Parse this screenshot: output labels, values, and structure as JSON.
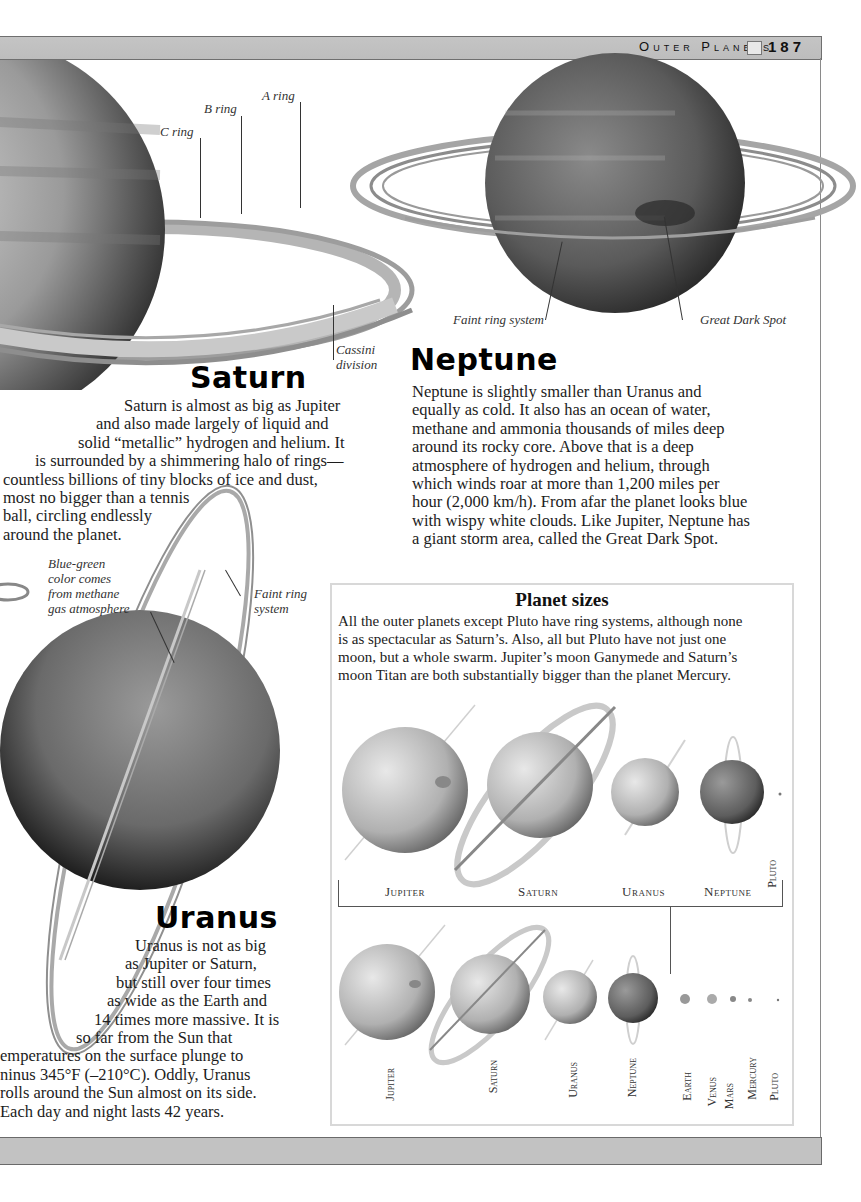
{
  "header": {
    "running_head": "Outer Planets",
    "page_icon": "book-page-icon",
    "page_number": "187"
  },
  "saturn": {
    "title": "Saturn",
    "labels": {
      "a_ring": "A ring",
      "b_ring": "B ring",
      "c_ring": "C ring",
      "cassini_line1": "Cassini",
      "cassini_line2": "division"
    },
    "body_lines": [
      "Saturn is almost as big as Jupiter",
      "and also made largely of liquid and",
      "solid “metallic” hydrogen and helium. It",
      "is surrounded by a shimmering halo of rings—",
      "countless billions of tiny blocks of ice and dust,",
      "most no bigger than a tennis",
      "ball, circling endlessly",
      "around the planet."
    ]
  },
  "neptune": {
    "title": "Neptune",
    "labels": {
      "faint_ring": "Faint ring system",
      "dark_spot": "Great Dark Spot"
    },
    "body_lines": [
      "Neptune is slightly smaller than Uranus and",
      "equally as cold. It also has an ocean of water,",
      "methane and ammonia thousands of miles deep",
      "around its rocky core. Above that is a deep",
      "atmosphere of hydrogen and helium, through",
      "which winds roar at more than 1,200 miles per",
      "hour (2,000 km/h). From afar the planet looks blue",
      "with wispy white clouds. Like Jupiter, Neptune has",
      "a giant storm area, called the Great Dark Spot."
    ]
  },
  "uranus": {
    "title": "Uranus",
    "labels": {
      "blue_green": [
        "Blue-green",
        "color comes",
        "from methane",
        "gas atmosphere"
      ],
      "faint_ring": [
        "Faint ring",
        "system"
      ]
    },
    "body_lines": [
      "Uranus is not as big",
      "as Jupiter or Saturn,",
      "but still over four times",
      "as wide as the Earth and",
      "14 times more massive. It is",
      "so far from the Sun that",
      "emperatures on the surface plunge to",
      "ninus 345°F (–210°C). Oddly, Uranus",
      "rolls around the Sun almost on its side.",
      "Each day and night lasts 42 years."
    ]
  },
  "planet_sizes": {
    "title": "Planet sizes",
    "text_lines": [
      "All the outer planets except Pluto have ring systems, although none",
      "is as spectacular as Saturn’s. Also, all but Pluto have not just one",
      "moon, but a whole swarm. Jupiter’s moon Ganymede and Saturn’s",
      "moon Titan are both substantially bigger than the planet Mercury."
    ],
    "row1_labels": [
      "Jupiter",
      "Saturn",
      "Uranus",
      "Neptune",
      "Pluto"
    ],
    "row2_labels": [
      "Jupiter",
      "Saturn",
      "Uranus",
      "Neptune",
      "Earth",
      "Venus",
      "Mars",
      "Mercury",
      "Pluto"
    ]
  }
}
